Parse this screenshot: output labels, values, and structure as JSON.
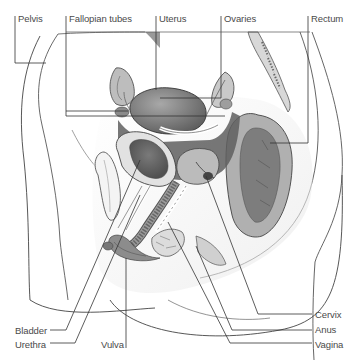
{
  "diagram": {
    "labels": {
      "pelvis": "Pelvis",
      "fallopian_tubes": "Fallopian tubes",
      "uterus": "Uterus",
      "ovaries": "Ovaries",
      "rectum": "Rectum",
      "bladder": "Bladder",
      "urethra": "Urethra",
      "vulva": "Vulva",
      "cervix": "Cervix",
      "anus": "Anus",
      "vagina": "Vagina"
    },
    "colors": {
      "line": "#333333",
      "label_text": "#4a4a4a",
      "tissue_dark": "#6e6e6e",
      "tissue_mid": "#9a9a9a",
      "tissue_light": "#c8c8c8",
      "skin": "#f2f2f2"
    }
  }
}
